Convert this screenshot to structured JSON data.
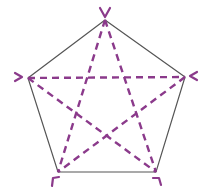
{
  "diagram": {
    "type": "pentagon-with-diagonals",
    "colors": {
      "outline": "#555555",
      "diagonals": "#8b3a8b",
      "background": "#ffffff"
    },
    "vertices": [
      {
        "id": "top",
        "x": 105,
        "y": 20
      },
      {
        "id": "right",
        "x": 185,
        "y": 77
      },
      {
        "id": "bottom-right",
        "x": 156,
        "y": 172
      },
      {
        "id": "bottom-left",
        "x": 58,
        "y": 172
      },
      {
        "id": "left",
        "x": 28,
        "y": 78
      }
    ],
    "diagonals": [
      [
        "top",
        "bottom-left"
      ],
      [
        "top",
        "bottom-right"
      ],
      [
        "left",
        "right"
      ],
      [
        "left",
        "bottom-right"
      ],
      [
        "right",
        "bottom-left"
      ]
    ]
  }
}
